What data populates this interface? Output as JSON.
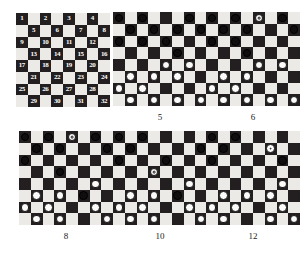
{
  "figure": {
    "type": "checkers-diagram-series",
    "colors": {
      "dark_square": "#231f20",
      "light_square": "#eceae6",
      "black_piece": "#100e0f",
      "white_piece": "#fbfbfa",
      "label_text": "#1a1a1a",
      "square_number_text": "#ffffff"
    },
    "board_size": 8
  },
  "boards": [
    {
      "id": "board-numbered",
      "caption": "",
      "mode": "numbered",
      "square_numbers": [
        1,
        2,
        3,
        4,
        5,
        6,
        7,
        8,
        9,
        10,
        11,
        12,
        13,
        14,
        15,
        16,
        17,
        18,
        19,
        20,
        21,
        22,
        23,
        24,
        25,
        26,
        27,
        28,
        29,
        30,
        31,
        32
      ],
      "pieces": []
    },
    {
      "id": "board-5",
      "caption": "5",
      "mode": "pieces",
      "pieces": [
        {
          "row": 0,
          "col": 0,
          "color": "black",
          "king": false
        },
        {
          "row": 0,
          "col": 2,
          "color": "black",
          "king": false
        },
        {
          "row": 0,
          "col": 6,
          "color": "black",
          "king": false
        },
        {
          "row": 1,
          "col": 1,
          "color": "black",
          "king": false
        },
        {
          "row": 1,
          "col": 3,
          "color": "black",
          "king": false
        },
        {
          "row": 1,
          "col": 5,
          "color": "black",
          "king": false
        },
        {
          "row": 1,
          "col": 7,
          "color": "black",
          "king": false
        },
        {
          "row": 2,
          "col": 0,
          "color": "black",
          "king": false
        },
        {
          "row": 2,
          "col": 2,
          "color": "black",
          "king": false
        },
        {
          "row": 2,
          "col": 4,
          "color": "black",
          "king": false
        },
        {
          "row": 3,
          "col": 5,
          "color": "black",
          "king": false
        },
        {
          "row": 4,
          "col": 4,
          "color": "white",
          "king": false
        },
        {
          "row": 4,
          "col": 6,
          "color": "white",
          "king": false
        },
        {
          "row": 5,
          "col": 1,
          "color": "white",
          "king": false
        },
        {
          "row": 5,
          "col": 3,
          "color": "white",
          "king": false
        },
        {
          "row": 5,
          "col": 5,
          "color": "white",
          "king": false
        },
        {
          "row": 6,
          "col": 0,
          "color": "white",
          "king": false
        },
        {
          "row": 6,
          "col": 2,
          "color": "white",
          "king": false
        },
        {
          "row": 7,
          "col": 1,
          "color": "white",
          "king": false
        },
        {
          "row": 7,
          "col": 3,
          "color": "white",
          "king": false
        },
        {
          "row": 7,
          "col": 5,
          "color": "white",
          "king": false
        },
        {
          "row": 7,
          "col": 7,
          "color": "white",
          "king": false
        }
      ]
    },
    {
      "id": "board-6",
      "caption": "6",
      "mode": "pieces",
      "pieces": [
        {
          "row": 0,
          "col": 0,
          "color": "black",
          "king": false
        },
        {
          "row": 0,
          "col": 2,
          "color": "black",
          "king": false
        },
        {
          "row": 0,
          "col": 4,
          "color": "white",
          "king": true
        },
        {
          "row": 0,
          "col": 6,
          "color": "black",
          "king": false
        },
        {
          "row": 1,
          "col": 1,
          "color": "black",
          "king": false
        },
        {
          "row": 1,
          "col": 3,
          "color": "black",
          "king": false
        },
        {
          "row": 1,
          "col": 7,
          "color": "black",
          "king": false
        },
        {
          "row": 2,
          "col": 0,
          "color": "black",
          "king": false
        },
        {
          "row": 2,
          "col": 2,
          "color": "black",
          "king": false
        },
        {
          "row": 3,
          "col": 3,
          "color": "black",
          "king": false
        },
        {
          "row": 4,
          "col": 4,
          "color": "white",
          "king": false
        },
        {
          "row": 4,
          "col": 6,
          "color": "white",
          "king": false
        },
        {
          "row": 5,
          "col": 1,
          "color": "white",
          "king": false
        },
        {
          "row": 5,
          "col": 3,
          "color": "white",
          "king": false
        },
        {
          "row": 6,
          "col": 0,
          "color": "white",
          "king": false
        },
        {
          "row": 6,
          "col": 2,
          "color": "white",
          "king": false
        },
        {
          "row": 7,
          "col": 1,
          "color": "white",
          "king": false
        },
        {
          "row": 7,
          "col": 3,
          "color": "white",
          "king": false
        },
        {
          "row": 7,
          "col": 5,
          "color": "white",
          "king": false
        },
        {
          "row": 7,
          "col": 7,
          "color": "white",
          "king": false
        }
      ]
    },
    {
      "id": "board-8",
      "caption": "8",
      "mode": "pieces",
      "pieces": [
        {
          "row": 0,
          "col": 0,
          "color": "black",
          "king": false
        },
        {
          "row": 0,
          "col": 2,
          "color": "black",
          "king": false
        },
        {
          "row": 0,
          "col": 4,
          "color": "white",
          "king": true
        },
        {
          "row": 0,
          "col": 6,
          "color": "black",
          "king": false
        },
        {
          "row": 1,
          "col": 1,
          "color": "black",
          "king": false
        },
        {
          "row": 1,
          "col": 3,
          "color": "black",
          "king": false
        },
        {
          "row": 1,
          "col": 7,
          "color": "black",
          "king": false
        },
        {
          "row": 2,
          "col": 0,
          "color": "black",
          "king": false
        },
        {
          "row": 3,
          "col": 3,
          "color": "black",
          "king": false
        },
        {
          "row": 4,
          "col": 6,
          "color": "white",
          "king": false
        },
        {
          "row": 5,
          "col": 1,
          "color": "white",
          "king": false
        },
        {
          "row": 5,
          "col": 3,
          "color": "white",
          "king": false
        },
        {
          "row": 5,
          "col": 5,
          "color": "black",
          "king": false
        },
        {
          "row": 6,
          "col": 0,
          "color": "white",
          "king": false
        },
        {
          "row": 6,
          "col": 2,
          "color": "white",
          "king": false
        },
        {
          "row": 6,
          "col": 6,
          "color": "white",
          "king": false
        },
        {
          "row": 7,
          "col": 1,
          "color": "white",
          "king": false
        },
        {
          "row": 7,
          "col": 3,
          "color": "white",
          "king": false
        },
        {
          "row": 7,
          "col": 7,
          "color": "white",
          "king": false
        }
      ]
    },
    {
      "id": "board-10",
      "caption": "10",
      "mode": "pieces",
      "pieces": [
        {
          "row": 0,
          "col": 0,
          "color": "black",
          "king": false
        },
        {
          "row": 0,
          "col": 2,
          "color": "black",
          "king": false
        },
        {
          "row": 1,
          "col": 1,
          "color": "black",
          "king": false
        },
        {
          "row": 1,
          "col": 7,
          "color": "black",
          "king": false
        },
        {
          "row": 2,
          "col": 0,
          "color": "black",
          "king": false
        },
        {
          "row": 2,
          "col": 4,
          "color": "black",
          "king": false
        },
        {
          "row": 3,
          "col": 3,
          "color": "white",
          "king": true
        },
        {
          "row": 4,
          "col": 6,
          "color": "white",
          "king": false
        },
        {
          "row": 5,
          "col": 1,
          "color": "white",
          "king": false
        },
        {
          "row": 5,
          "col": 3,
          "color": "white",
          "king": false
        },
        {
          "row": 5,
          "col": 5,
          "color": "black",
          "king": false
        },
        {
          "row": 6,
          "col": 0,
          "color": "white",
          "king": false
        },
        {
          "row": 6,
          "col": 2,
          "color": "white",
          "king": false
        },
        {
          "row": 6,
          "col": 6,
          "color": "white",
          "king": false
        },
        {
          "row": 7,
          "col": 1,
          "color": "white",
          "king": false
        },
        {
          "row": 7,
          "col": 3,
          "color": "white",
          "king": false
        },
        {
          "row": 7,
          "col": 7,
          "color": "white",
          "king": false
        }
      ]
    },
    {
      "id": "board-12",
      "caption": "12",
      "mode": "pieces",
      "pieces": [
        {
          "row": 0,
          "col": 0,
          "color": "black",
          "king": false
        },
        {
          "row": 0,
          "col": 2,
          "color": "black",
          "king": false
        },
        {
          "row": 1,
          "col": 1,
          "color": "black",
          "king": false
        },
        {
          "row": 1,
          "col": 5,
          "color": "white",
          "king": true
        },
        {
          "row": 2,
          "col": 0,
          "color": "black",
          "king": false
        },
        {
          "row": 2,
          "col": 6,
          "color": "black",
          "king": false
        },
        {
          "row": 4,
          "col": 6,
          "color": "white",
          "king": false
        },
        {
          "row": 5,
          "col": 1,
          "color": "white",
          "king": false
        },
        {
          "row": 5,
          "col": 3,
          "color": "white",
          "king": false
        },
        {
          "row": 5,
          "col": 5,
          "color": "white",
          "king": false
        },
        {
          "row": 6,
          "col": 0,
          "color": "white",
          "king": false
        },
        {
          "row": 6,
          "col": 2,
          "color": "white",
          "king": false
        },
        {
          "row": 6,
          "col": 6,
          "color": "white",
          "king": false
        },
        {
          "row": 7,
          "col": 1,
          "color": "white",
          "king": false
        },
        {
          "row": 7,
          "col": 5,
          "color": "white",
          "king": false
        },
        {
          "row": 7,
          "col": 7,
          "color": "white",
          "king": false
        }
      ]
    }
  ],
  "layout": {
    "positions": [
      {
        "left": 16,
        "top": 13,
        "caption_top": 108
      },
      {
        "left": 113,
        "top": 12,
        "caption_top": 112
      },
      {
        "left": 206,
        "top": 12,
        "caption_top": 112
      },
      {
        "left": 19,
        "top": 131,
        "caption_top": 231
      },
      {
        "left": 113,
        "top": 131,
        "caption_top": 231
      },
      {
        "left": 206,
        "top": 131,
        "caption_top": 231
      }
    ]
  }
}
